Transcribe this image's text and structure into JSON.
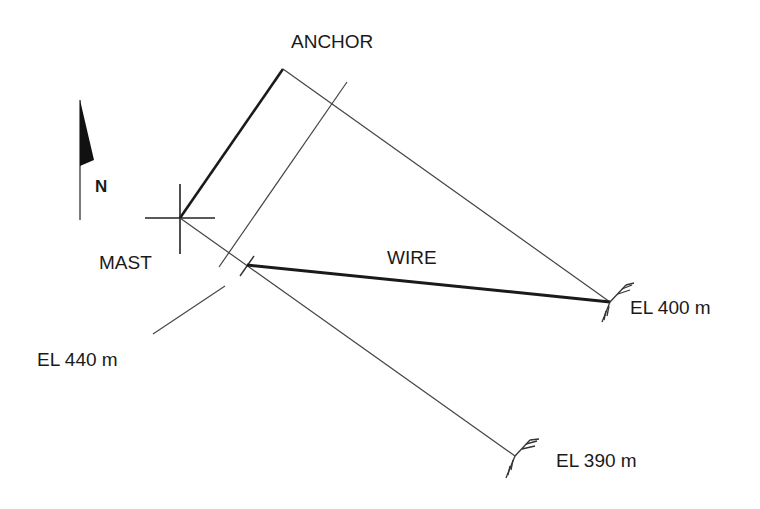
{
  "diagram": {
    "labels": {
      "anchor": "ANCHOR",
      "mast": "MAST",
      "wire": "WIRE",
      "north": "N",
      "el_400": "EL 400 m",
      "el_390": "EL 390 m",
      "el_440": "EL 440 m"
    },
    "points": {
      "anchor": {
        "x": 283,
        "y": 69
      },
      "mast": {
        "x": 180,
        "y": 218
      },
      "wire_start": {
        "x": 247,
        "y": 265
      },
      "el_400_point": {
        "x": 610,
        "y": 302
      },
      "el_390_point": {
        "x": 515,
        "y": 456
      }
    },
    "colors": {
      "line": "#333333",
      "heavy_line": "#1a1a1a",
      "background": "#ffffff"
    }
  }
}
